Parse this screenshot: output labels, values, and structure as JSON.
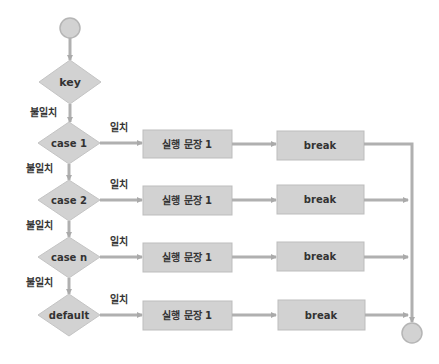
{
  "diagram": {
    "type": "flowchart",
    "colors": {
      "fill": "#d2d2d2",
      "stroke": "#b5b5b5",
      "line": "#b0b0b0",
      "text": "#333333"
    },
    "start": {
      "label": ""
    },
    "end": {
      "label": ""
    },
    "key": {
      "label": "key",
      "no_match_label": "불일치"
    },
    "cases": [
      {
        "condition": "case 1",
        "match_label": "일치",
        "statement": "실행 문장 1",
        "break": "break",
        "no_match_label": "불일치"
      },
      {
        "condition": "case 2",
        "match_label": "일치",
        "statement": "실행 문장 1",
        "break": "break",
        "no_match_label": "불일치"
      },
      {
        "condition": "case n",
        "match_label": "일치",
        "statement": "실행 문장 1",
        "break": "break",
        "no_match_label": "불일치"
      },
      {
        "condition": "default",
        "match_label": "일치",
        "statement": "실행 문장 1",
        "break": "break"
      }
    ]
  }
}
